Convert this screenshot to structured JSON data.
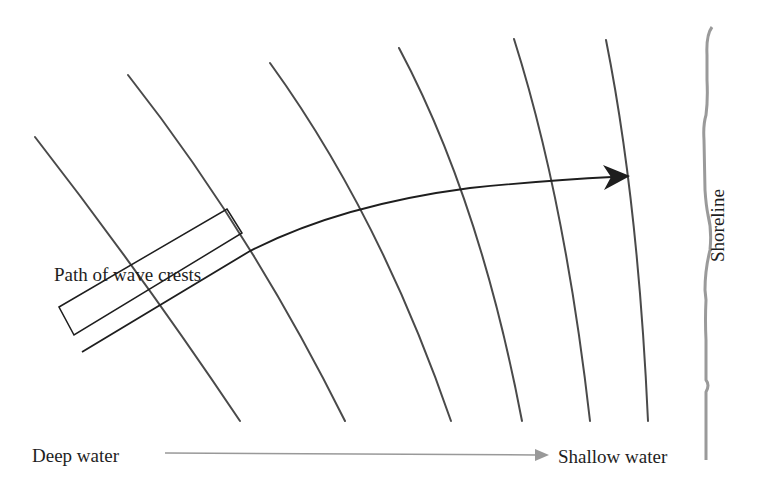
{
  "diagram": {
    "labels": {
      "path_of_wave_crests": "Path of wave crests",
      "deep_water": "Deep water",
      "shallow_water": "Shallow water",
      "shoreline": "Shoreline"
    },
    "colors": {
      "crest_line": "#4a4a4a",
      "path_arrow": "#1e1e1e",
      "depth_arrow": "#999999",
      "shoreline": "#9a9a9a",
      "text": "#1e1e1e"
    },
    "wave_crest_count": 6,
    "elements": [
      "wave crest lines (curved, converging toward shoreline)",
      "orthogonal path arrow bending toward shore",
      "rectangular label box along path",
      "depth gradient arrow from deep to shallow water",
      "wavy shoreline boundary"
    ]
  }
}
